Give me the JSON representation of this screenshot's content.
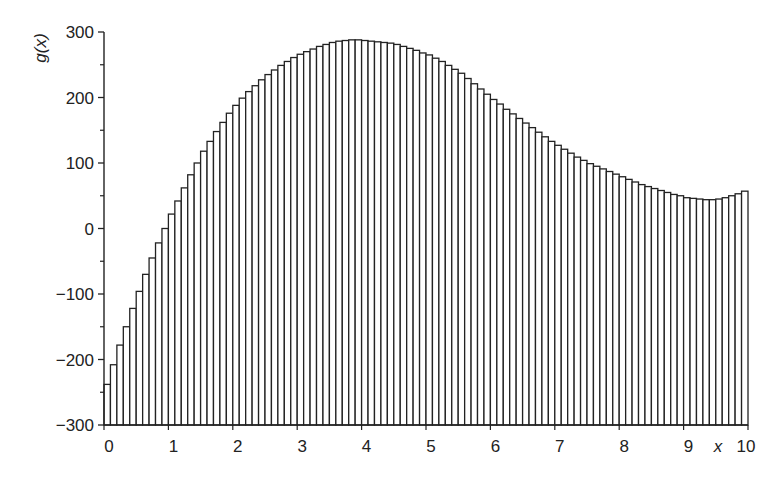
{
  "chart_data": {
    "type": "bar",
    "title": "",
    "xlabel": "x",
    "ylabel": "g(x)",
    "xlim": [
      0,
      10
    ],
    "ylim": [
      -300,
      300
    ],
    "grid": false,
    "legend": null,
    "bar_width": 0.1,
    "x_ticks": [
      0,
      1,
      2,
      3,
      4,
      5,
      6,
      7,
      8,
      9,
      10
    ],
    "x_tick_labels": [
      "0",
      "1",
      "2",
      "3",
      "4",
      "5",
      "6",
      "7",
      "8",
      "9",
      "10"
    ],
    "y_ticks": [
      -300,
      -200,
      -100,
      0,
      100,
      200,
      300
    ],
    "y_tick_labels": [
      "−300",
      "−200",
      "−100",
      "0",
      "100",
      "200",
      "300"
    ],
    "y_minor_ticks": [
      -250,
      -150,
      -50,
      50,
      150,
      250
    ],
    "x": [
      0.0,
      0.1,
      0.2,
      0.3,
      0.4,
      0.5,
      0.6,
      0.7,
      0.8,
      0.9,
      1.0,
      1.1,
      1.2,
      1.3,
      1.4,
      1.5,
      1.6,
      1.7,
      1.8,
      1.9,
      2.0,
      2.1,
      2.2,
      2.3,
      2.4,
      2.5,
      2.6,
      2.7,
      2.8,
      2.9,
      3.0,
      3.1,
      3.2,
      3.3,
      3.4,
      3.5,
      3.6,
      3.7,
      3.8,
      3.9,
      4.0,
      4.1,
      4.2,
      4.3,
      4.4,
      4.5,
      4.6,
      4.7,
      4.8,
      4.9,
      5.0,
      5.1,
      5.2,
      5.3,
      5.4,
      5.5,
      5.6,
      5.7,
      5.8,
      5.9,
      6.0,
      6.1,
      6.2,
      6.3,
      6.4,
      6.5,
      6.6,
      6.7,
      6.8,
      6.9,
      7.0,
      7.1,
      7.2,
      7.3,
      7.4,
      7.5,
      7.6,
      7.7,
      7.8,
      7.9,
      8.0,
      8.1,
      8.2,
      8.3,
      8.4,
      8.5,
      8.6,
      8.7,
      8.8,
      8.9,
      9.0,
      9.1,
      9.2,
      9.3,
      9.4,
      9.5,
      9.6,
      9.7,
      9.8,
      9.9
    ],
    "values": [
      -238,
      -208,
      -178,
      -150,
      -122,
      -96,
      -70,
      -45,
      -22,
      0,
      22,
      42,
      62,
      82,
      100,
      118,
      133,
      148,
      162,
      176,
      188,
      199,
      209,
      218,
      227,
      235,
      242,
      249,
      255,
      261,
      266,
      270,
      274,
      278,
      281,
      284,
      286,
      287,
      288,
      288,
      287,
      286,
      285,
      284,
      283,
      281,
      278,
      275,
      272,
      268,
      265,
      260,
      255,
      249,
      243,
      237,
      229,
      221,
      213,
      205,
      197,
      190,
      182,
      175,
      168,
      161,
      154,
      147,
      140,
      133,
      127,
      121,
      115,
      109,
      104,
      99,
      95,
      91,
      87,
      83,
      79,
      75,
      71,
      67,
      64,
      61,
      58,
      55,
      52,
      50,
      47,
      46,
      45,
      44,
      44,
      45,
      47,
      50,
      53,
      57
    ]
  }
}
